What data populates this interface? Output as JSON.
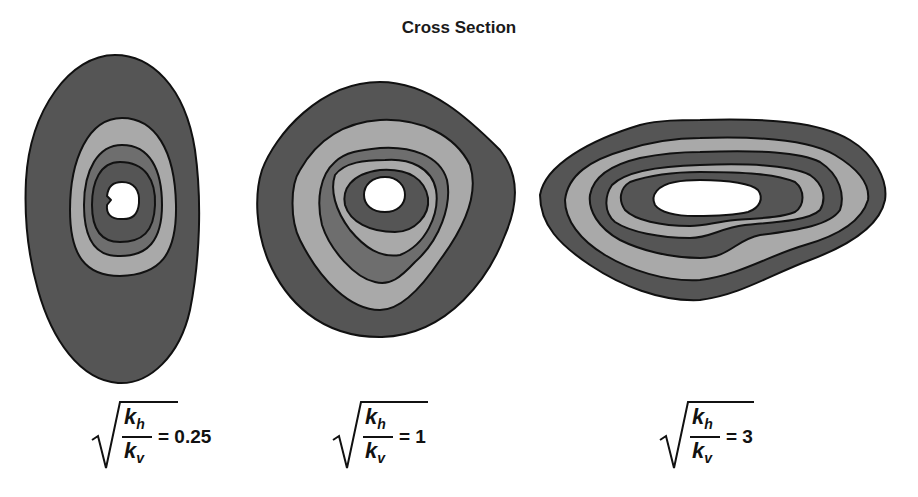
{
  "title": "Cross Section",
  "colors": {
    "outer_band": "#555555",
    "light_band": "#a9a9a9",
    "mid_band": "#6e6e6e",
    "inner_band": "#555555",
    "core": "#ffffff",
    "outline": "#111111"
  },
  "panels": [
    {
      "label_numerator": "k",
      "label_numerator_sub": "h",
      "label_denominator": "k",
      "label_denominator_sub": "v",
      "equals": "= 0.25",
      "ratio": 0.25
    },
    {
      "label_numerator": "k",
      "label_numerator_sub": "h",
      "label_denominator": "k",
      "label_denominator_sub": "v",
      "equals": "= 1",
      "ratio": 1
    },
    {
      "label_numerator": "k",
      "label_numerator_sub": "h",
      "label_denominator": "k",
      "label_denominator_sub": "v",
      "equals": "= 3",
      "ratio": 3
    }
  ]
}
